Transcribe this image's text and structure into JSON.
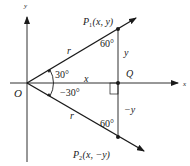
{
  "diagram": {
    "axes": {
      "x_label": "x",
      "y_label": "y",
      "origin_label": "O"
    },
    "points": {
      "p1": {
        "name": "P",
        "subscript": "1",
        "coords": "(x, y)"
      },
      "p2": {
        "name": "P",
        "subscript": "2",
        "coords": "(x, −y)"
      },
      "q": {
        "name": "Q"
      }
    },
    "segments": {
      "op1_length": "r",
      "op2_length": "r",
      "oq_length": "x",
      "qp1_length": "y",
      "qp2_length": "−y"
    },
    "angles": {
      "upper_at_origin": "30°",
      "lower_at_origin": "−30°",
      "at_p1": "60°",
      "at_p2": "60°"
    },
    "colors": {
      "line": "#1a1a1a",
      "background": "#ffffff"
    }
  }
}
